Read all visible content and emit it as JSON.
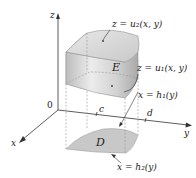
{
  "figure": {
    "axes": {
      "z_label": "z",
      "y_label": "y",
      "x_label": "x",
      "origin_label": "0",
      "c_label": "c",
      "d_label": "d"
    },
    "labels": {
      "top_surface": "z = u₂(x, y)",
      "bottom_surface": "z = u₁(x, y)",
      "solid": "E",
      "region": "D",
      "left_boundary": "x = h₁(y)",
      "right_boundary": "x = h₂(y)"
    },
    "colors": {
      "solid_fill": "#d4d4d4",
      "region_fill": "#c8c8c8",
      "axis": "#333333"
    }
  }
}
